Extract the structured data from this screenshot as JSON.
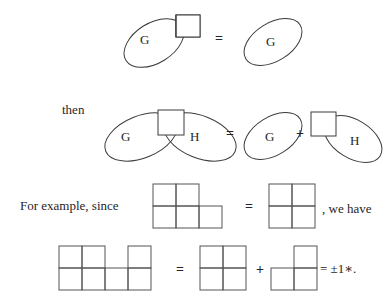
{
  "figure": {
    "type": "math-diagram",
    "background_color": "#ffffff",
    "stroke_color": "#3a3a3a",
    "text_color": "#262626",
    "rows": [
      {
        "id": "row-1",
        "items": [
          {
            "kind": "blob-with-square",
            "label": "G",
            "square_position": "upper-right"
          },
          {
            "kind": "operator",
            "symbol": "="
          },
          {
            "kind": "blob",
            "label": "G"
          }
        ]
      },
      {
        "id": "row-2",
        "lead_text": "then",
        "items": [
          {
            "kind": "blob",
            "label": "G"
          },
          {
            "kind": "square"
          },
          {
            "kind": "blob",
            "label": "H"
          },
          {
            "kind": "operator",
            "symbol": "="
          },
          {
            "kind": "blob",
            "label": "G"
          },
          {
            "kind": "operator",
            "symbol": "+"
          },
          {
            "kind": "square"
          },
          {
            "kind": "blob",
            "label": "H"
          }
        ]
      },
      {
        "id": "row-3",
        "lead_text": "For example, since",
        "trail_text": ", we have",
        "items": [
          {
            "kind": "polyomino",
            "name": "p-shape-5cell",
            "cells": [
              [
                0,
                0
              ],
              [
                0,
                1
              ],
              [
                1,
                0
              ],
              [
                1,
                1
              ],
              [
                1,
                2
              ]
            ],
            "cols": 3,
            "rows": 2
          },
          {
            "kind": "operator",
            "symbol": "="
          },
          {
            "kind": "polyomino",
            "name": "square-2x2",
            "cells": [
              [
                0,
                0
              ],
              [
                0,
                1
              ],
              [
                1,
                0
              ],
              [
                1,
                1
              ]
            ],
            "cols": 2,
            "rows": 2
          }
        ]
      },
      {
        "id": "row-4",
        "items": [
          {
            "kind": "polyomino",
            "name": "seven-cell-shape",
            "cells": [
              [
                0,
                0
              ],
              [
                0,
                1
              ],
              [
                0,
                3
              ],
              [
                1,
                0
              ],
              [
                1,
                1
              ],
              [
                1,
                2
              ],
              [
                1,
                3
              ]
            ],
            "cols": 4,
            "rows": 2
          },
          {
            "kind": "operator",
            "symbol": "="
          },
          {
            "kind": "polyomino",
            "name": "square-2x2",
            "cells": [
              [
                0,
                0
              ],
              [
                0,
                1
              ],
              [
                1,
                0
              ],
              [
                1,
                1
              ]
            ],
            "cols": 2,
            "rows": 2
          },
          {
            "kind": "operator",
            "symbol": "+"
          },
          {
            "kind": "polyomino",
            "name": "l-triomino",
            "cells": [
              [
                0,
                1
              ],
              [
                1,
                0
              ],
              [
                1,
                1
              ]
            ],
            "cols": 2,
            "rows": 2
          },
          {
            "kind": "result",
            "text": "= ±1∗."
          }
        ]
      }
    ],
    "labels": {
      "g": "G",
      "h": "H",
      "then": "then",
      "for_example_since": "For example, since",
      "we_have": ", we have",
      "equals": "=",
      "plus": "+",
      "result": "= ±1∗."
    }
  }
}
